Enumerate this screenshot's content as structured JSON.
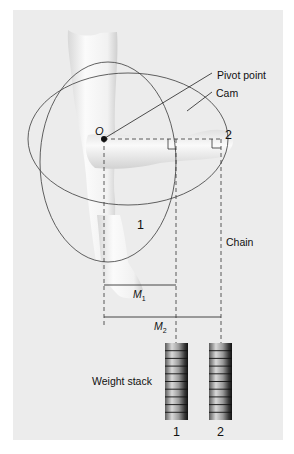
{
  "figure": {
    "labels": {
      "pivot_point": "Pivot point",
      "cam": "Cam",
      "origin": "O",
      "position_1": "1",
      "position_2": "2",
      "chain": "Chain",
      "moment_arm_1": "M",
      "moment_arm_1_sub": "1",
      "moment_arm_2": "M",
      "moment_arm_2_sub": "2",
      "weight_stack": "Weight stack",
      "stack_1": "1",
      "stack_2": "2"
    },
    "colors": {
      "panel_background": "#ececec",
      "line": "#3a3a3a",
      "arm_skin": "#f4f4f4",
      "weight_dark": "#2a2a2a",
      "weight_light": "#bdbdbd"
    },
    "weight_plates_per_stack": 10
  }
}
